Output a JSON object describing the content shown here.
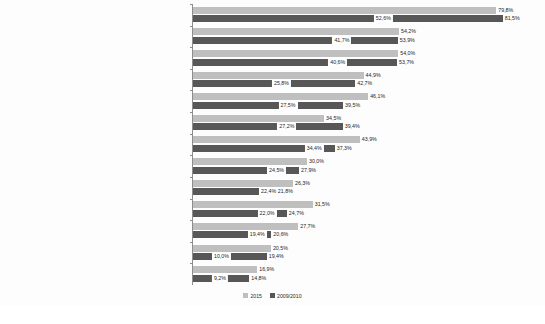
{
  "chart_data": {
    "type": "bar",
    "orientation": "horizontal",
    "title": "",
    "subtitle": "",
    "xlabel": "",
    "ylabel": "",
    "xlim": [
      0,
      90
    ],
    "grid": false,
    "legend_position": "bottom",
    "categories": [
      "Zeit für Zuwendung/Patientengespräche",
      "Entwicklung/Aktualisierung von Pflegeplänen/-behandlungspfaden",
      "Beratung/Anleitung von Patienten und/oder ihren Angehörigen",
      "Planung der Pflege",
      "Adäquate Dokumentation der Pflegearbeit",
      "Mundpflege",
      "Adäquate Patientenüberwachung",
      "Hautpflege",
      "Vorbereitung von Patienten auf die Entlassung",
      "Regelmäßiges Umlagern von Patienten",
      "Zeitgerechte Verabreichung von Medikamenten",
      "Schmerzmanagement",
      "Behandlungen und Prozeduren"
    ],
    "series": [
      {
        "name": "2015",
        "color": "#bfbfbf",
        "values": [
          79.8,
          54.2,
          54.0,
          44.9,
          46.1,
          34.5,
          43.9,
          30.0,
          26.3,
          31.5,
          27.7,
          20.5,
          16.9
        ],
        "labels": [
          "79,8%",
          "54,2%",
          "54,0%",
          "44,9%",
          "46,1%",
          "34,5%",
          "43,9%",
          "30,0%",
          "26,3%",
          "31,5%",
          "27,7%",
          "20,5%",
          "16,9%"
        ]
      },
      {
        "name": "2009/2010",
        "color": "#575757",
        "values": [
          81.5,
          53.9,
          53.7,
          42.7,
          39.5,
          39.4,
          37.3,
          27.9,
          21.8,
          24.7,
          20.6,
          19.4,
          14.8
        ],
        "labels": [
          "81,5%",
          "53,9%",
          "53,7%",
          "42,7%",
          "39,5%",
          "39,4%",
          "37,3%",
          "27,9%",
          "21,8%",
          "24,7%",
          "20,6%",
          "19,4%",
          "14,8%"
        ]
      }
    ],
    "overlay_labels": {
      "note": "white-boxed value labels drawn over the dark bars",
      "values": [
        52.6,
        41.7,
        40.6,
        25.8,
        27.5,
        27.2,
        34.4,
        24.5,
        22.4,
        22.0,
        19.4,
        10.0,
        9.2
      ],
      "labels": [
        "52,6%",
        "41,7%",
        "40,6%",
        "25,8%",
        "27,5%",
        "27,2%",
        "34,4%",
        "24,5%",
        "22,4%",
        "22,0%",
        "19,4%",
        "10,0%",
        "9,2%"
      ]
    }
  },
  "legend": {
    "items": [
      {
        "label": "2015",
        "color": "#bfbfbf"
      },
      {
        "label": "2009/2010",
        "color": "#575757"
      }
    ]
  }
}
